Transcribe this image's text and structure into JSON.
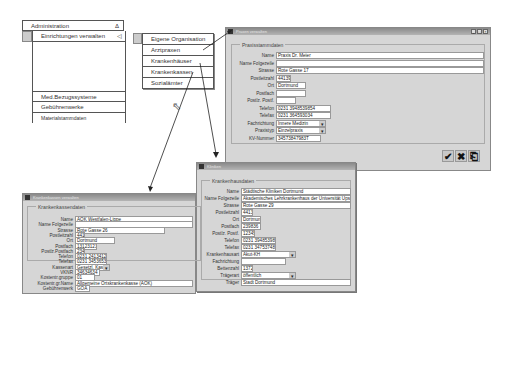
{
  "menu": {
    "header": "Administration",
    "header_icon": "triangle-icon",
    "items": [
      {
        "label": "Einrichtungen verwalten",
        "has_submenu": true
      },
      {
        "label": "Med.Bezugssysteme"
      },
      {
        "label": "Gebührenwerke"
      },
      {
        "label": "Materialstammdaten"
      }
    ],
    "submenu": [
      "Eigene Organisation",
      "Arztpraxen",
      "Krankenhäuser",
      "Krankenkassen",
      "Sozialämter"
    ]
  },
  "windows": {
    "praxis": {
      "title": "Praxen verwalten",
      "group": "Praxisstammdaten",
      "fields": [
        {
          "label": "Name",
          "value": "Praxis Dr. Meier"
        },
        {
          "label": "Name Folgezeile",
          "value": ""
        },
        {
          "label": "Strasse",
          "value": "Rote Gasse 17"
        },
        {
          "label": "Postleitzahl",
          "value": "44139"
        },
        {
          "label": "Ort",
          "value": "Dortmund"
        },
        {
          "label": "Postfach",
          "value": ""
        },
        {
          "label": "Postlz. Postf.",
          "value": ""
        },
        {
          "label": "Telefon",
          "value": "0231 3948539854"
        },
        {
          "label": "Telefax",
          "value": "0231 364593034"
        },
        {
          "label": "Fachrichtung",
          "value": "Innere Medizin"
        },
        {
          "label": "Praxistyp",
          "value": "Einzelpraxis"
        },
        {
          "label": "KV-Nummer",
          "value": "34573847983T"
        }
      ]
    },
    "krankenhaus": {
      "title": "Kliniken",
      "group": "Krankenhausdaten",
      "fields": [
        {
          "label": "Name",
          "value": "Städtische Kliniken Dortmund"
        },
        {
          "label": "Name Folgezeile",
          "value": "Akademisches Lehrkrankenhaus der Universität Upsala"
        },
        {
          "label": "Strasse",
          "value": "Rote Gasse 29"
        },
        {
          "label": "Postleitzahl",
          "value": "44139"
        },
        {
          "label": "Ort",
          "value": "Dortmund"
        },
        {
          "label": "Postfach",
          "value": "239836"
        },
        {
          "label": "Postlz. Postf.",
          "value": "12345"
        },
        {
          "label": "Telefon",
          "value": "0231 394853985"
        },
        {
          "label": "Telefax",
          "value": "0231 3475374834"
        },
        {
          "label": "Krankenhausart",
          "value": "Akut-KH"
        },
        {
          "label": "Fachrichtung",
          "value": ""
        },
        {
          "label": "Bettenzahl",
          "value": "1372"
        },
        {
          "label": "Trägerart",
          "value": "öffentlich"
        },
        {
          "label": "Träger",
          "value": "Stadt Dortmund"
        }
      ]
    },
    "krankenkasse": {
      "title": "Krankenkassen verwalten",
      "group": "Krankenkassendaten",
      "fields": [
        {
          "label": "Name",
          "value": "AOK Westfalen-Lippe"
        },
        {
          "label": "Name Folgezeile",
          "value": ""
        },
        {
          "label": "Strasse",
          "value": "Rote Gasse 26"
        },
        {
          "label": "Postleitzahl",
          "value": "44139"
        },
        {
          "label": "Ort",
          "value": "Dortmund"
        },
        {
          "label": "Postfach",
          "value": "13123123"
        },
        {
          "label": "Postlz.Postfach",
          "value": "23454"
        },
        {
          "label": "Telefon",
          "value": "0231 2413412421"
        },
        {
          "label": "Telefax",
          "value": "0231 3453653453"
        },
        {
          "label": "Kassenart",
          "value": "Gesetzl. Kasse"
        },
        {
          "label": "VKNR",
          "value": "34634634"
        },
        {
          "label": "Kostentr.gruppe",
          "value": "01"
        },
        {
          "label": "Kostentr.gr.Name",
          "value": "Allgemeine Ortskrankenkasse (AOK)"
        },
        {
          "label": "Gebührenwerk",
          "value": "GOA"
        }
      ]
    }
  },
  "window_buttons": {
    "minimize": "_",
    "maximize": "□",
    "close": "×"
  },
  "actions": {
    "ok": "✔",
    "cancel": "✖",
    "exit": "⎗"
  }
}
